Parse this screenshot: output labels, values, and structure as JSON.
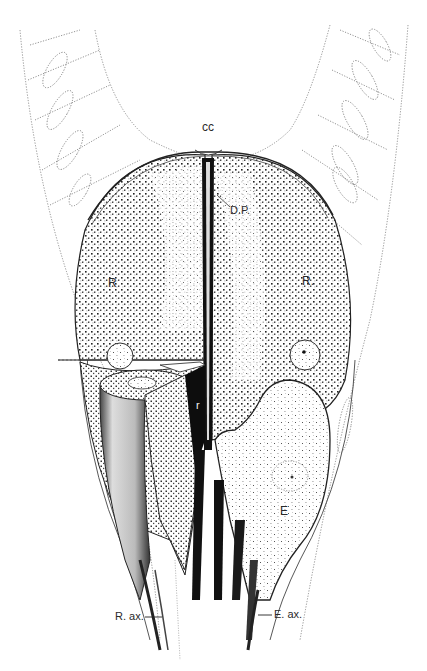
{
  "figure": {
    "colors": {
      "ink": "#1a1a1a",
      "paper": "#ffffff",
      "stipple": "#222222",
      "dotted_outline": "#6a6a6a"
    }
  },
  "labels": {
    "cc": "cc",
    "dp": "D.P.",
    "r_left": "R",
    "r_right": "R.",
    "r_small": "r",
    "e": "E",
    "r_ax": "R. ax.",
    "e_ax": "E. ax."
  }
}
